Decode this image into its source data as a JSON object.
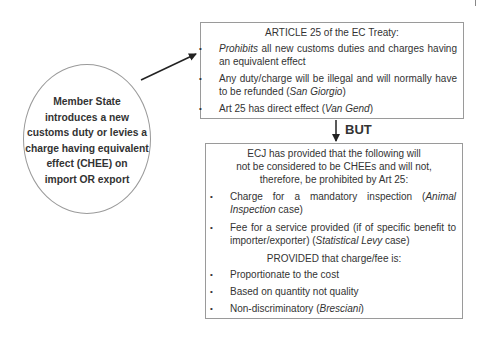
{
  "ellipse": {
    "lines": [
      "Member State",
      "introduces a new",
      "customs duty or levies a",
      "charge having equivalent",
      "effect (CHEE) on",
      "import OR export"
    ]
  },
  "top_box": {
    "title": "ARTICLE 25 of the EC Treaty:",
    "items": [
      {
        "italic": "Prohibits",
        "text": " all new customs duties and charges having an equivalent effect",
        "case": ""
      },
      {
        "italic": "",
        "text": "Any duty/charge will be illegal and will normally have to be refunded (",
        "case": "San Giorgio",
        "after": ")"
      },
      {
        "italic": "",
        "text": "Art 25 has direct effect (",
        "case": "Van Gend",
        "after": ")"
      }
    ]
  },
  "connector_label": "BUT",
  "bottom_box": {
    "title_lines": [
      "ECJ has provided that the following will",
      "not be considered to be CHEEs and will not,",
      "therefore, be prohibited by Art 25:"
    ],
    "items": [
      {
        "text": "Charge for a mandatory inspection (",
        "case": "Animal Inspection",
        "after": " case)"
      },
      {
        "text": "Fee for a service provided (if of specific benefit to importer/exporter) (",
        "case": "Statistical Levy",
        "after": " case)"
      }
    ],
    "provided_label": "PROVIDED that charge/fee is:",
    "conditions": [
      {
        "text": "Proportionate to the cost",
        "case": "",
        "after": ""
      },
      {
        "text": "Based on quantity not quality",
        "case": "",
        "after": ""
      },
      {
        "text": "Non-discriminatory (",
        "case": "Bresciani",
        "after": ")"
      }
    ]
  }
}
